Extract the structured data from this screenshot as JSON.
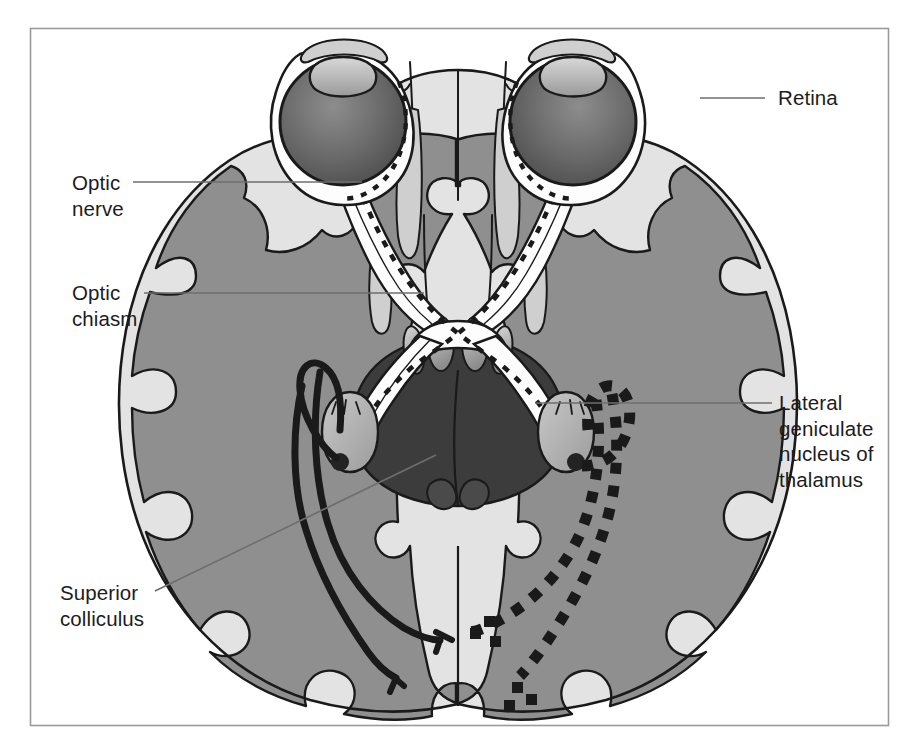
{
  "figure": {
    "frame": {
      "color": "#9a9a9a"
    },
    "palette": {
      "background": "#ffffff",
      "cortex_gray": "#8f8f8f",
      "white_matter": "#e3e3e3",
      "brainstem_dark": "#3c3c3c",
      "eye_globe_dark": "#555555",
      "eye_globe_light": "#8a8a8a",
      "outline": "#1a1a1a",
      "leader_line": "#6e6e6e",
      "tract_white": "#fdfdfd"
    }
  },
  "labels": [
    {
      "id": "retina",
      "name": "label-retina",
      "text": "Retina",
      "x": 778,
      "y": 85,
      "align": "left",
      "leader": {
        "x1": 700,
        "y1": 98,
        "x2": 765,
        "y2": 98
      }
    },
    {
      "id": "optic-nerve",
      "name": "label-optic-nerve",
      "text": "Optic\nnerve",
      "x": 72,
      "y": 170,
      "align": "left",
      "leader": {
        "x1": 133,
        "y1": 182,
        "x2": 362,
        "y2": 182
      }
    },
    {
      "id": "optic-chiasm",
      "name": "label-optic-chiasm",
      "text": "Optic\nchiasm",
      "x": 72,
      "y": 280,
      "align": "left",
      "leader": {
        "x1": 144,
        "y1": 293,
        "x2": 424,
        "y2": 293
      }
    },
    {
      "id": "lgn",
      "name": "label-lateral-geniculate-nucleus",
      "text": "Lateral\ngeniculate\nnucleus of\nthalamus",
      "x": 779,
      "y": 390,
      "align": "left",
      "leader": {
        "x1": 535,
        "y1": 403,
        "x2": 772,
        "y2": 403
      }
    },
    {
      "id": "superior-colliculus",
      "name": "label-superior-colliculus",
      "text": "Superior\ncolliculus",
      "x": 60,
      "y": 580,
      "align": "left",
      "leader": {
        "x1": 155,
        "y1": 591,
        "x2": 436,
        "y2": 455
      }
    }
  ],
  "anatomy": {
    "structures": [
      {
        "name": "left-eye",
        "label": "Left eye"
      },
      {
        "name": "right-eye",
        "label": "Right eye"
      },
      {
        "name": "left-lens",
        "label": "Left lens"
      },
      {
        "name": "right-lens",
        "label": "Right lens"
      },
      {
        "name": "left-optic-nerve",
        "label": "Left optic nerve"
      },
      {
        "name": "right-optic-nerve",
        "label": "Right optic nerve"
      },
      {
        "name": "optic-chiasm",
        "label": "Optic chiasm"
      },
      {
        "name": "left-optic-tract",
        "label": "Left optic tract"
      },
      {
        "name": "right-optic-tract",
        "label": "Right optic tract"
      },
      {
        "name": "left-lateral-geniculate-nucleus",
        "label": "Left LGN"
      },
      {
        "name": "right-lateral-geniculate-nucleus",
        "label": "Right LGN"
      },
      {
        "name": "left-optic-radiation",
        "label": "Left optic radiation (solid)"
      },
      {
        "name": "right-optic-radiation",
        "label": "Right optic radiation (dashed)"
      },
      {
        "name": "superior-colliculus",
        "label": "Superior colliculus"
      },
      {
        "name": "mammillary-bodies",
        "label": "Mammillary bodies"
      },
      {
        "name": "midbrain",
        "label": "Midbrain"
      },
      {
        "name": "frontal-lobes",
        "label": "Frontal lobes"
      },
      {
        "name": "temporal-lobes",
        "label": "Temporal lobes"
      },
      {
        "name": "occipital-lobes",
        "label": "Occipital lobes"
      },
      {
        "name": "cerebral-cortex",
        "label": "Cerebral cortex"
      }
    ]
  }
}
